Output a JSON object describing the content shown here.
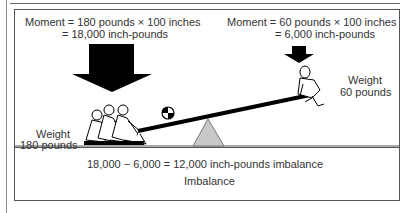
{
  "diagram": {
    "left_moment": {
      "line1": "Moment = 180 pounds × 100 inches",
      "line2": "= 18,000 inch-pounds"
    },
    "right_moment": {
      "line1": "Moment = 60 pounds × 100 inches",
      "line2": "= 6,000 inch-pounds"
    },
    "left_weight": {
      "line1": "Weight",
      "line2": "180 pounds"
    },
    "right_weight": {
      "line1": "Weight",
      "line2": "60 pounds"
    },
    "equation": "18,000 − 6,000 = 12,000 inch-pounds imbalance",
    "caption": "Imbalance",
    "colors": {
      "arrow": "#000000",
      "fulcrum": "#c8c8c8",
      "frame": "#555555",
      "beam": "#000000"
    }
  }
}
